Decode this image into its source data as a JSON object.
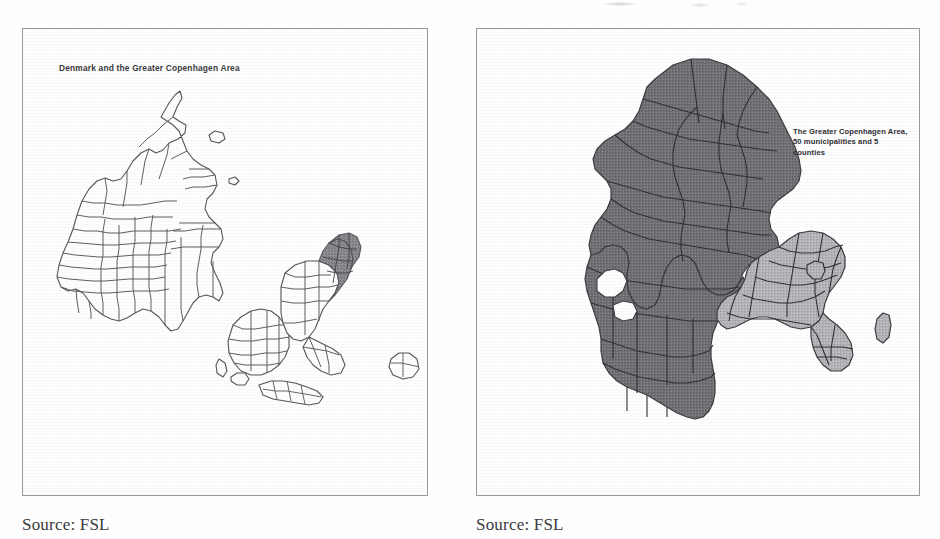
{
  "document": {
    "type": "scanned-figure-page",
    "panel_count": 2
  },
  "left_panel": {
    "title": "Denmark and the Greater Copenhagen Area",
    "source_caption": "Source: FSL",
    "map": {
      "subject": "Denmark",
      "detail": "municipality boundaries",
      "highlight_region": "Greater Copenhagen Area",
      "outline_color": "#55555a",
      "fill_color": "#ffffff",
      "highlight_fill_color": "#8e8e93",
      "islands": [
        "Jutland",
        "Funen",
        "Zealand",
        "Lolland-Falster",
        "Bornholm",
        "Laeso",
        "Samso",
        "Anholt"
      ]
    }
  },
  "right_panel": {
    "title": "",
    "source_caption": "Source: FSL",
    "annotation": "The Greater Copenhagen Area, 50 municipalities and 5 counties",
    "map": {
      "subject": "Zealand",
      "detail": "county and municipality boundaries",
      "base_fill_color": "#6f6f74",
      "highlight_fill_color": "#b4b4b8",
      "outline_color": "#3a3a3e",
      "highlight_region": "Greater Copenhagen Area",
      "municipalities": 50,
      "counties": 5,
      "separate_island": "Ven"
    }
  },
  "colors": {
    "paper": "#fefefe",
    "frame_border": "#9a9a9e",
    "ink": "#3a3a3e",
    "map_dark_gray": "#6f6f74",
    "map_light_gray": "#b4b4b8"
  }
}
